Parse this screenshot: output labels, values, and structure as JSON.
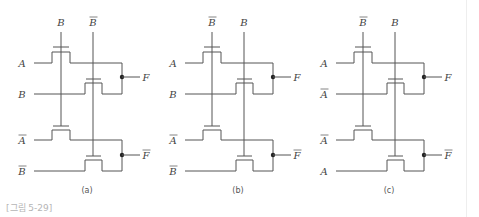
{
  "figure": {
    "caption": "[그림 5-29]",
    "panels": [
      {
        "id": "a",
        "sublabel": "(a)",
        "top_gate_labels": [
          {
            "text": "B",
            "bar": false
          },
          {
            "text": "B",
            "bar": true
          }
        ],
        "top_inputs": [
          {
            "text": "A",
            "bar": false
          },
          {
            "text": "B",
            "bar": false
          }
        ],
        "bottom_inputs": [
          {
            "text": "A",
            "bar": true
          },
          {
            "text": "B",
            "bar": true
          }
        ],
        "outputs": [
          {
            "text": "F",
            "bar": false
          },
          {
            "text": "F",
            "bar": true
          }
        ]
      },
      {
        "id": "b",
        "sublabel": "(b)",
        "top_gate_labels": [
          {
            "text": "B",
            "bar": true
          },
          {
            "text": "B",
            "bar": false
          }
        ],
        "top_inputs": [
          {
            "text": "A",
            "bar": false
          },
          {
            "text": "B",
            "bar": false
          }
        ],
        "bottom_inputs": [
          {
            "text": "A",
            "bar": true
          },
          {
            "text": "B",
            "bar": true
          }
        ],
        "outputs": [
          {
            "text": "F",
            "bar": false
          },
          {
            "text": "F",
            "bar": true
          }
        ]
      },
      {
        "id": "c",
        "sublabel": "(c)",
        "top_gate_labels": [
          {
            "text": "B",
            "bar": true
          },
          {
            "text": "B",
            "bar": false
          }
        ],
        "top_inputs": [
          {
            "text": "A",
            "bar": false
          },
          {
            "text": "A",
            "bar": true
          }
        ],
        "bottom_inputs": [
          {
            "text": "A",
            "bar": true
          },
          {
            "text": "A",
            "bar": false
          }
        ],
        "outputs": [
          {
            "text": "F",
            "bar": false
          },
          {
            "text": "F",
            "bar": true
          }
        ]
      }
    ]
  }
}
